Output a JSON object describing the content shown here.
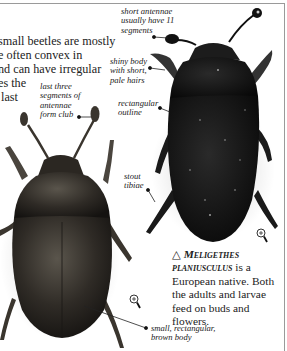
{
  "intro_text": "small beetles are mostly\ne often convex in\nnd can have irregular\nes the\n last",
  "labels": {
    "antennae_club": "last three\nsegments of\nantennae\nform club",
    "short_antennae": "short antennae\nusually have 11\nsegments",
    "shiny_body": "shiny body\nwith short,\npale hairs",
    "rectangular_outline": "rectangular\noutline",
    "stout_tibiae": "stout\ntibiae",
    "small_body": "small, rectangular,\nbrown body"
  },
  "caption": {
    "symbol": "△",
    "species": "Meligethes planiusculus",
    "text": " is a European native. Both the adults and larvae feed on buds and flowers."
  },
  "icons": {
    "magnifier_1": "magnifier-icon",
    "magnifier_2": "magnifier-icon"
  },
  "colors": {
    "beetle_brown": "#2e2a24",
    "beetle_black": "#141414",
    "text": "#222222",
    "frame": "#9a9a9a"
  }
}
